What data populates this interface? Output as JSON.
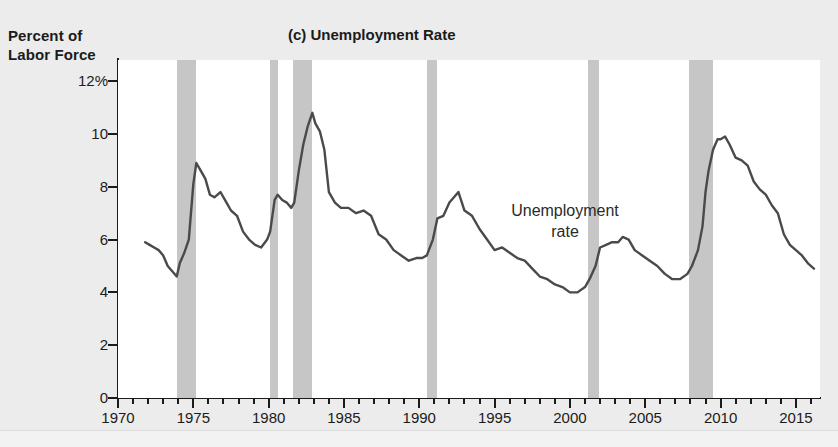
{
  "figure": {
    "title": "(c) Unemployment Rate",
    "y_axis_title_line1": "Percent of",
    "y_axis_title_line2": "Labor Force",
    "annotation_line1": "Unemployment",
    "annotation_line2": "rate",
    "series_color": "#4a4a4a",
    "recession_color": "#c6c6c6",
    "axis_color": "#1b1b1b",
    "plot_background": "#ffffff",
    "page_background": "#ececec"
  },
  "chart_data": {
    "type": "line",
    "title": "(c) Unemployment Rate",
    "xlabel": "",
    "ylabel": "Percent of Labor Force",
    "xlim": [
      1970,
      2016.6
    ],
    "ylim": [
      0,
      12.8
    ],
    "grid": false,
    "legend": "none",
    "y_ticks": [
      0,
      2,
      4,
      6,
      8,
      10,
      12
    ],
    "y_tick_labels": [
      "0",
      "2",
      "4",
      "6",
      "8",
      "10",
      "12%"
    ],
    "x_major_ticks": [
      1970,
      1975,
      1980,
      1985,
      1990,
      1995,
      2000,
      2005,
      2010,
      2015
    ],
    "x_major_labels": [
      "1970",
      "1975",
      "1980",
      "1985",
      "1990",
      "1995",
      "2000",
      "2005",
      "2010",
      "2015"
    ],
    "x_minor_tick_interval": 1,
    "annotations": [
      {
        "text": "Unemployment rate",
        "x": 1996.0,
        "y": 6.6
      }
    ],
    "shaded_regions": [
      {
        "label": "recession-1973-1975",
        "x0": 1973.9,
        "x1": 1975.2
      },
      {
        "label": "recession-1980",
        "x0": 1980.1,
        "x1": 1980.6
      },
      {
        "label": "recession-1981-1982",
        "x0": 1981.6,
        "x1": 1982.9
      },
      {
        "label": "recession-1990-1991",
        "x0": 1990.5,
        "x1": 1991.2
      },
      {
        "label": "recession-2001",
        "x0": 2001.2,
        "x1": 2001.9
      },
      {
        "label": "recession-2007-2009",
        "x0": 2007.9,
        "x1": 2009.5
      }
    ],
    "series": [
      {
        "name": "Unemployment rate",
        "units": "percent of labor force",
        "x": [
          1971.8,
          1972.1,
          1972.4,
          1972.7,
          1973.0,
          1973.3,
          1973.6,
          1973.9,
          1974.1,
          1974.4,
          1974.7,
          1975.0,
          1975.2,
          1975.5,
          1975.8,
          1976.1,
          1976.4,
          1976.8,
          1977.1,
          1977.5,
          1977.9,
          1978.3,
          1978.7,
          1979.1,
          1979.5,
          1979.9,
          1980.1,
          1980.4,
          1980.6,
          1980.9,
          1981.2,
          1981.5,
          1981.7,
          1982.0,
          1982.3,
          1982.6,
          1982.9,
          1983.1,
          1983.4,
          1983.7,
          1984.0,
          1984.4,
          1984.8,
          1985.3,
          1985.8,
          1986.3,
          1986.8,
          1987.3,
          1987.8,
          1988.3,
          1988.8,
          1989.3,
          1989.8,
          1990.2,
          1990.5,
          1990.9,
          1991.2,
          1991.6,
          1992.0,
          1992.3,
          1992.6,
          1993.0,
          1993.5,
          1994.0,
          1994.5,
          1995.0,
          1995.5,
          1996.0,
          1996.5,
          1997.0,
          1997.5,
          1998.0,
          1998.5,
          1999.0,
          1999.5,
          2000.0,
          2000.5,
          2001.0,
          2001.3,
          2001.7,
          2002.0,
          2002.4,
          2002.8,
          2003.2,
          2003.5,
          2003.9,
          2004.3,
          2004.8,
          2005.3,
          2005.8,
          2006.3,
          2006.8,
          2007.3,
          2007.8,
          2008.1,
          2008.5,
          2008.8,
          2009.0,
          2009.2,
          2009.5,
          2009.8,
          2010.0,
          2010.3,
          2010.6,
          2011.0,
          2011.4,
          2011.8,
          2012.2,
          2012.6,
          2013.0,
          2013.4,
          2013.8,
          2014.2,
          2014.6,
          2015.0,
          2015.4,
          2015.8,
          2016.2
        ],
        "y": [
          5.9,
          5.8,
          5.7,
          5.6,
          5.4,
          5.0,
          4.8,
          4.6,
          5.1,
          5.5,
          6.0,
          8.1,
          8.9,
          8.6,
          8.3,
          7.7,
          7.6,
          7.8,
          7.5,
          7.1,
          6.9,
          6.3,
          6.0,
          5.8,
          5.7,
          6.0,
          6.3,
          7.5,
          7.7,
          7.5,
          7.4,
          7.2,
          7.4,
          8.6,
          9.6,
          10.3,
          10.8,
          10.4,
          10.1,
          9.4,
          7.8,
          7.4,
          7.2,
          7.2,
          7.0,
          7.1,
          6.9,
          6.2,
          6.0,
          5.6,
          5.4,
          5.2,
          5.3,
          5.3,
          5.4,
          6.0,
          6.8,
          6.9,
          7.4,
          7.6,
          7.8,
          7.1,
          6.9,
          6.4,
          6.0,
          5.6,
          5.7,
          5.5,
          5.3,
          5.2,
          4.9,
          4.6,
          4.5,
          4.3,
          4.2,
          4.0,
          4.0,
          4.2,
          4.5,
          5.0,
          5.7,
          5.8,
          5.9,
          5.9,
          6.1,
          6.0,
          5.6,
          5.4,
          5.2,
          5.0,
          4.7,
          4.5,
          4.5,
          4.7,
          5.0,
          5.6,
          6.5,
          7.8,
          8.6,
          9.4,
          9.8,
          9.8,
          9.9,
          9.6,
          9.1,
          9.0,
          8.8,
          8.2,
          7.9,
          7.7,
          7.3,
          7.0,
          6.2,
          5.8,
          5.6,
          5.4,
          5.1,
          4.9
        ]
      }
    ]
  }
}
